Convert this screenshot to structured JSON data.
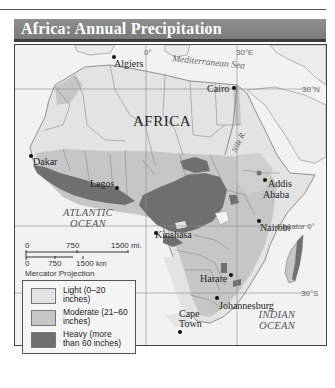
{
  "title": "Africa: Annual Precipitation",
  "colors": {
    "light": "#e3e3e3",
    "moderate": "#c6c6c6",
    "heavy": "#6f6f6f",
    "water": "#f2f2f2",
    "title_bar": "#858585",
    "title_border": "#3c3c3c"
  },
  "map": {
    "continent_label": "AFRICA",
    "water_labels": {
      "mediterranean": "Mediterranean Sea",
      "atlantic_line1": "ATLANTIC",
      "atlantic_line2": "OCEAN",
      "indian_line1": "INDIAN",
      "indian_line2": "OCEAN"
    },
    "river_label": "Nile R.",
    "grid_labels": {
      "lon_0": "0°",
      "lon_30e": "30°E",
      "lat_30n": "30°N",
      "equator": "Equator 0°",
      "lat_30s": "30°S"
    },
    "cities": [
      {
        "name": "Algiers"
      },
      {
        "name": "Cairo"
      },
      {
        "name": "Dakar"
      },
      {
        "name": "Lagos"
      },
      {
        "name": "Addis",
        "name2": "Ababa"
      },
      {
        "name": "Kinshasa"
      },
      {
        "name": "Nairobi"
      },
      {
        "name": "Harare"
      },
      {
        "name": "Johannesburg"
      },
      {
        "name": "Cape",
        "name2": "Town"
      }
    ]
  },
  "scale_bar": {
    "mi_0": "0",
    "mi_750": "750",
    "mi_1500": "1500 mi.",
    "km_0": "0",
    "km_750": "750",
    "km_1500": "1500 km",
    "projection": "Mercator Projection"
  },
  "legend": {
    "items": [
      {
        "line1": "Light (0–20",
        "line2": "inches)",
        "color": "#e3e3e3"
      },
      {
        "line1": "Moderate (21–60",
        "line2": "inches)",
        "color": "#c6c6c6"
      },
      {
        "line1": "Heavy (more",
        "line2": "than 60 inches)",
        "color": "#6f6f6f"
      }
    ]
  }
}
